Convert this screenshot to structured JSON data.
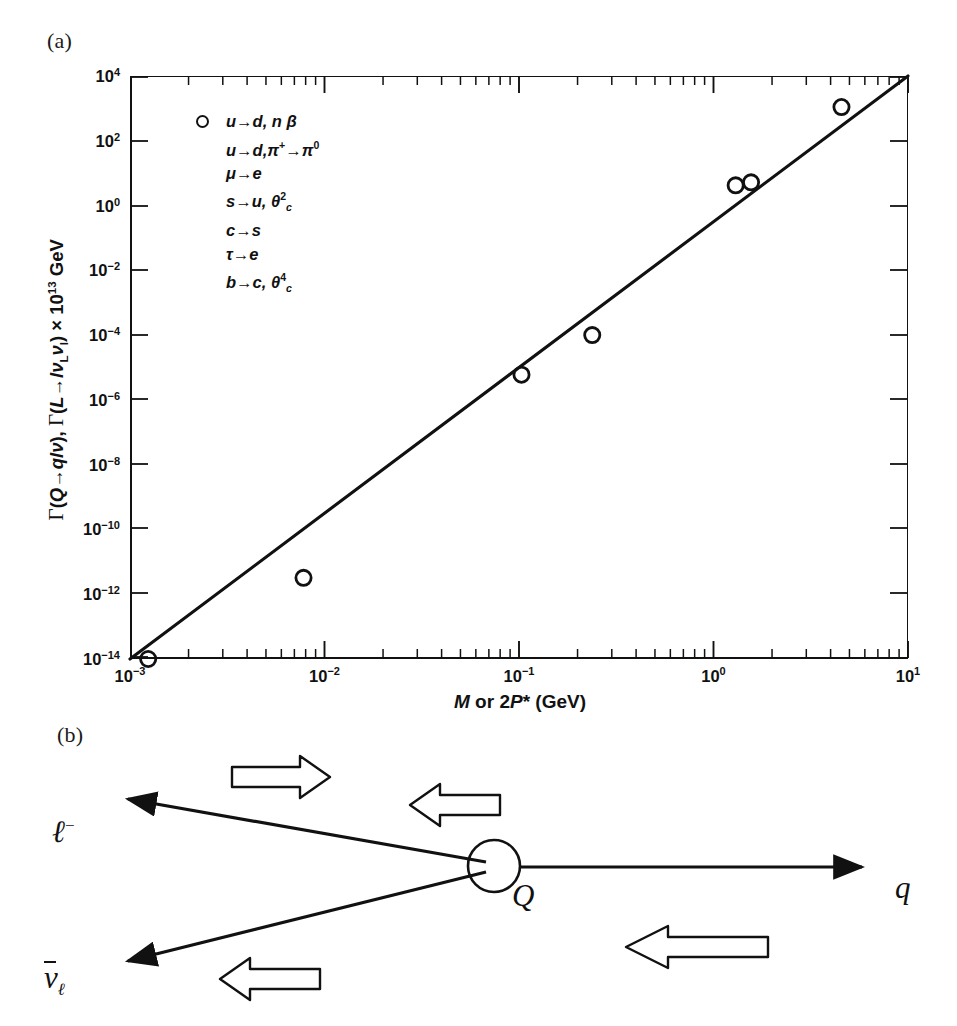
{
  "figure": {
    "panel_a_tag": "(a)",
    "panel_b_tag": "(b)"
  },
  "chart_data": {
    "type": "scatter",
    "title": "",
    "xlabel": "M or 2P* (GeV)",
    "ylabel": "Γ(Q→qlν), Γ(L→lν_Lν_l) × 10^13 GeV",
    "xscale": "log",
    "yscale": "log",
    "xlim": [
      0.001,
      10
    ],
    "ylim": [
      1e-14,
      10000.0
    ],
    "grid": false,
    "legend_position": "upper-left-inside",
    "xticks": [
      {
        "value": 0.001,
        "label": "10⁻³",
        "mantissa": "10",
        "exponent": "−3"
      },
      {
        "value": 0.01,
        "label": "10⁻²",
        "mantissa": "10",
        "exponent": "−2"
      },
      {
        "value": 0.1,
        "label": "10⁻¹",
        "mantissa": "10",
        "exponent": "−1"
      },
      {
        "value": 1,
        "label": "10⁰",
        "mantissa": "10",
        "exponent": "0"
      },
      {
        "value": 10,
        "label": "10¹",
        "mantissa": "10",
        "exponent": "1"
      }
    ],
    "yticks": [
      {
        "value": 10000.0,
        "mantissa": "10",
        "exponent": "4"
      },
      {
        "value": 100.0,
        "mantissa": "10",
        "exponent": "2"
      },
      {
        "value": 1.0,
        "mantissa": "10",
        "exponent": "0"
      },
      {
        "value": 0.01,
        "mantissa": "10",
        "exponent": "−2"
      },
      {
        "value": 0.0001,
        "mantissa": "10",
        "exponent": "−4"
      },
      {
        "value": 1e-06,
        "mantissa": "10",
        "exponent": "−6"
      },
      {
        "value": 1e-08,
        "mantissa": "10",
        "exponent": "−8"
      },
      {
        "value": 1e-10,
        "mantissa": "10",
        "exponent": "−10"
      },
      {
        "value": 1e-12,
        "mantissa": "10",
        "exponent": "−12"
      },
      {
        "value": 1e-14,
        "mantissa": "10",
        "exponent": "−14"
      }
    ],
    "series": [
      {
        "name": "measured decay rates",
        "marker": "open-circle",
        "color": "#111111",
        "points": [
          {
            "x": 0.00124,
            "y": 1e-14,
            "label": "u→d, nβ"
          },
          {
            "x": 0.0078,
            "y": 3.2e-12,
            "label": "u→d, π⁺→π⁰"
          },
          {
            "x": 0.103,
            "y": 6e-06,
            "label": "μ→e"
          },
          {
            "x": 0.238,
            "y": 0.0001,
            "label": "s→u, θc²"
          },
          {
            "x": 1.3,
            "y": 4.2,
            "label": "c→s"
          },
          {
            "x": 1.56,
            "y": 5.2,
            "label": "τ→e"
          },
          {
            "x": 4.55,
            "y": 1100.0,
            "label": "b→c, θc⁴"
          }
        ]
      }
    ],
    "fit_line": {
      "description": "power-law reference line through the data",
      "x_start": 0.001,
      "y_start": 1e-14,
      "x_end": 10.0,
      "y_end": 10000.0,
      "slope_decades_per_decade": 4.5
    },
    "legend": {
      "marker": "open-circle",
      "entries": [
        {
          "from": "u",
          "to": "d",
          "extra": "n β"
        },
        {
          "from": "u",
          "to": "d",
          "extra": "π⁺→π⁰"
        },
        {
          "from": "μ",
          "to": "e",
          "extra": ""
        },
        {
          "from": "s",
          "to": "u",
          "extra": "θc²"
        },
        {
          "from": "c",
          "to": "s",
          "extra": ""
        },
        {
          "from": "τ",
          "to": "e",
          "extra": ""
        },
        {
          "from": "b",
          "to": "c",
          "extra": "θc⁴"
        }
      ]
    }
  },
  "legend_lines": {
    "l0_a": "u",
    "l0_b": "d, n",
    "l0_c": "β",
    "l1_a": "u",
    "l1_b": "d,π",
    "l1_sup1": "+",
    "l1_c": "π",
    "l1_sup2": "0",
    "l2_a": "μ",
    "l2_b": "e",
    "l3_a": "s",
    "l3_b": "u, θ",
    "l3_sup": "2",
    "l3_sub": "c",
    "l4_a": "c",
    "l4_b": "s",
    "l5_a": "τ",
    "l5_b": "e",
    "l6_a": "b",
    "l6_b": "c, θ",
    "l6_sup": "4",
    "l6_sub": "c",
    "arrow": "→"
  },
  "axis_titles": {
    "x_m": "M",
    "x_or": " or 2",
    "x_p": "P",
    "x_star": "*",
    "x_unit": " (GeV)",
    "y_gamma1": "Γ",
    "y_part1": "(",
    "y_Q": "Q",
    "y_arrow": "→",
    "y_qlnu": "qlν",
    "y_part2": "), ",
    "y_gamma2": "Γ",
    "y_part3": "(",
    "y_L": "L",
    "y_lnu": "lν",
    "y_subL": "L",
    "y_nu2": "ν",
    "y_subl": "l",
    "y_part4": ") × 10",
    "y_exp": "13",
    "y_unit": " GeV"
  },
  "diagram": {
    "vertex_label": "Q",
    "quark_label": "q",
    "lepton_label": "ℓ",
    "lepton_charge": "−",
    "antineutrino_label": "ν",
    "antineutrino_sub": "ℓ",
    "momentum_arrows": [
      {
        "name": "top-right-arrow",
        "direction": "right"
      },
      {
        "name": "upper-incoming-arrow",
        "direction": "left"
      },
      {
        "name": "lower-left-arrow",
        "direction": "left"
      },
      {
        "name": "lower-right-arrow",
        "direction": "left"
      }
    ]
  }
}
